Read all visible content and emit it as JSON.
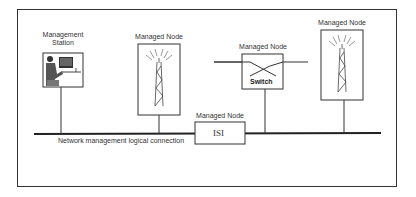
{
  "diagram": {
    "nodes": [
      {
        "id": "management-station",
        "label_line1": "Management",
        "label_line2": "Station",
        "type": "workstation"
      },
      {
        "id": "managed-node-tower-1",
        "label": "Managed Node",
        "type": "radio-tower"
      },
      {
        "id": "managed-node-switch",
        "label": "Managed Node",
        "type": "switch",
        "inner_label": "Switch"
      },
      {
        "id": "managed-node-tower-2",
        "label": "Managed Node",
        "type": "radio-tower"
      },
      {
        "id": "managed-node-isi",
        "label": "Managed Node",
        "type": "isi",
        "inner_label": "ISI"
      }
    ],
    "bus_label": "Network management logical connection",
    "colors": {
      "line": "#222222",
      "frame": "#333333",
      "background": "#ffffff"
    }
  }
}
